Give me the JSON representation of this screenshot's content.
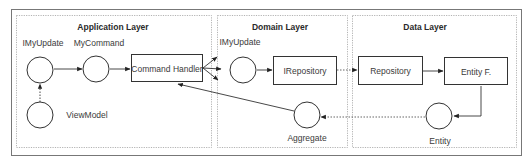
{
  "layers": [
    {
      "title": "Application Layer"
    },
    {
      "title": "Domain Layer"
    },
    {
      "title": "Data Layer"
    }
  ],
  "nodes": {
    "app_imyupdate": {
      "label": "IMyUpdate",
      "shape": "circle"
    },
    "app_mycommand": {
      "label": "MyCommand",
      "shape": "circle"
    },
    "command_handler": {
      "label": "Command  Handler",
      "shape": "box"
    },
    "viewmodel": {
      "label": "ViewModel",
      "shape": "circle"
    },
    "domain_imyupdate": {
      "label": "IMyUpdate",
      "shape": "circle"
    },
    "irepository": {
      "label": "IRepository",
      "shape": "box"
    },
    "aggregate": {
      "label": "Aggregate",
      "shape": "circle"
    },
    "repository": {
      "label": "Repository",
      "shape": "box"
    },
    "entity_factory": {
      "label": "Entity F.",
      "shape": "box"
    },
    "entity": {
      "label": "Entity",
      "shape": "circle"
    }
  },
  "edges": [
    {
      "from": "viewmodel",
      "to": "app_imyupdate",
      "style": "dotted"
    },
    {
      "from": "app_imyupdate",
      "to": "app_mycommand",
      "style": "solid"
    },
    {
      "from": "app_mycommand",
      "to": "command_handler",
      "style": "solid"
    },
    {
      "from": "command_handler",
      "to": "domain_imyupdate",
      "style": "solid",
      "count": 3
    },
    {
      "from": "domain_imyupdate",
      "to": "irepository",
      "style": "solid"
    },
    {
      "from": "irepository",
      "to": "repository",
      "style": "dotted"
    },
    {
      "from": "repository",
      "to": "entity_factory",
      "style": "solid"
    },
    {
      "from": "entity_factory",
      "to": "entity",
      "style": "solid"
    },
    {
      "from": "entity",
      "to": "aggregate",
      "style": "dotted"
    },
    {
      "from": "aggregate",
      "to": "command_handler",
      "style": "solid"
    }
  ]
}
